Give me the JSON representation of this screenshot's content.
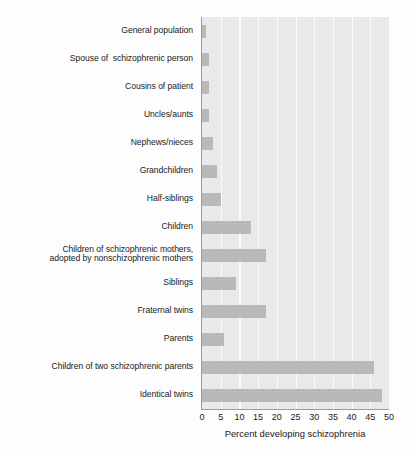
{
  "chart_data": {
    "type": "bar",
    "orientation": "horizontal",
    "title": "",
    "xlabel": "Percent developing schizophrenia",
    "ylabel": "",
    "xlim": [
      0,
      50
    ],
    "xticks": [
      0,
      5,
      10,
      15,
      20,
      25,
      30,
      35,
      40,
      45,
      50
    ],
    "grid": true,
    "legend": false,
    "categories": [
      "General population",
      "Spouse of  schizophrenic person",
      "Cousins of patient",
      "Uncles/aunts",
      "Nephews/nieces",
      "Grandchildren",
      "Half-siblings",
      "Children",
      "Children of schizophrenic mothers,\nadopted by nonschizophrenic mothers",
      "Siblings",
      "Fraternal twins",
      "Parents",
      "Children of two schizophrenic parents",
      "Identical twins"
    ],
    "values": [
      1,
      2,
      2,
      2,
      3,
      4,
      5,
      13,
      17,
      9,
      17,
      6,
      46,
      48
    ],
    "colors": {
      "bar": "#b9b9b9",
      "plot_background": "#e9e9e9",
      "gridline": "#fbfbfb",
      "axis": "#9b9b9b",
      "text": "#1b1b1b",
      "page_background": "#fdfdfd"
    }
  }
}
